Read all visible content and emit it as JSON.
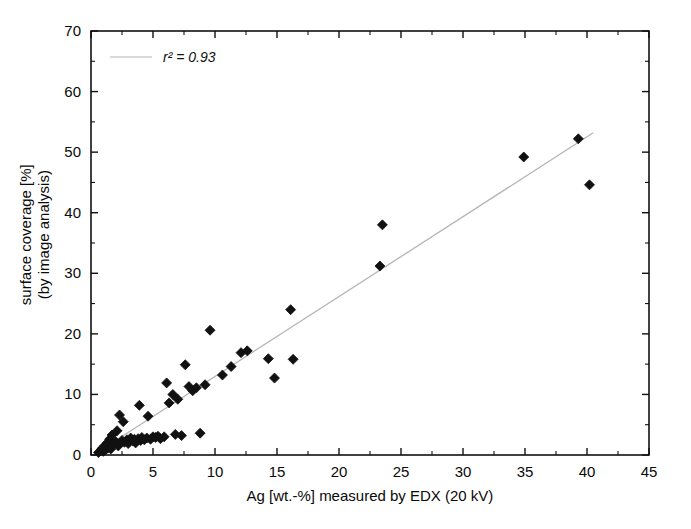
{
  "chart_data": {
    "type": "scatter",
    "title": "",
    "xlabel": "Ag [wt.-%] measured by EDX (20 kV)",
    "ylabel": "surface coverage [%]\n(by image analysis)",
    "ylabel_line1": "surface coverage [%]",
    "ylabel_line2": "(by image analysis)",
    "xlim": [
      0,
      45
    ],
    "ylim": [
      0,
      70
    ],
    "xticks": [
      0,
      5,
      10,
      15,
      20,
      25,
      30,
      35,
      40,
      45
    ],
    "yticks": [
      0,
      10,
      20,
      30,
      40,
      50,
      60,
      70
    ],
    "xminor_step": 2.5,
    "yminor_step": 5,
    "grid": false,
    "legend": {
      "position": "upper-left-inside",
      "entries": [
        {
          "label": "r² = 0.93",
          "marker": "line",
          "color": "#b0b0b0"
        }
      ],
      "r_squared": 0.93
    },
    "series": [
      {
        "name": "measurements",
        "marker": "diamond",
        "color": "#111111",
        "points": [
          [
            0.6,
            0.4
          ],
          [
            0.8,
            0.7
          ],
          [
            0.9,
            1.1
          ],
          [
            1.0,
            0.6
          ],
          [
            1.1,
            1.5
          ],
          [
            1.2,
            0.9
          ],
          [
            1.3,
            2.0
          ],
          [
            1.4,
            1.2
          ],
          [
            1.5,
            2.6
          ],
          [
            1.6,
            1.0
          ],
          [
            1.7,
            3.3
          ],
          [
            1.8,
            1.8
          ],
          [
            2.0,
            2.2
          ],
          [
            2.1,
            4.0
          ],
          [
            2.2,
            1.5
          ],
          [
            2.3,
            6.6
          ],
          [
            2.5,
            2.4
          ],
          [
            2.6,
            5.5
          ],
          [
            2.7,
            2.1
          ],
          [
            2.9,
            2.5
          ],
          [
            3.0,
            1.9
          ],
          [
            3.2,
            2.8
          ],
          [
            3.4,
            2.3
          ],
          [
            3.5,
            2.6
          ],
          [
            3.6,
            2.0
          ],
          [
            3.8,
            2.7
          ],
          [
            3.9,
            8.2
          ],
          [
            4.0,
            2.4
          ],
          [
            4.1,
            2.9
          ],
          [
            4.3,
            2.5
          ],
          [
            4.5,
            2.8
          ],
          [
            4.6,
            6.4
          ],
          [
            4.8,
            2.6
          ],
          [
            5.0,
            3.0
          ],
          [
            5.2,
            2.9
          ],
          [
            5.4,
            3.1
          ],
          [
            5.6,
            2.7
          ],
          [
            5.9,
            3.0
          ],
          [
            6.1,
            11.9
          ],
          [
            6.3,
            8.6
          ],
          [
            6.6,
            10.0
          ],
          [
            6.8,
            3.4
          ],
          [
            7.0,
            9.2
          ],
          [
            7.3,
            3.2
          ],
          [
            7.6,
            14.9
          ],
          [
            7.9,
            11.3
          ],
          [
            8.2,
            10.6
          ],
          [
            8.5,
            11.1
          ],
          [
            8.8,
            3.6
          ],
          [
            9.2,
            11.6
          ],
          [
            9.6,
            20.6
          ],
          [
            10.6,
            13.2
          ],
          [
            11.3,
            14.6
          ],
          [
            12.1,
            16.9
          ],
          [
            12.6,
            17.2
          ],
          [
            14.3,
            15.9
          ],
          [
            14.8,
            12.7
          ],
          [
            16.1,
            24.0
          ],
          [
            16.3,
            15.8
          ],
          [
            23.3,
            31.2
          ],
          [
            23.5,
            38.0
          ],
          [
            34.9,
            49.2
          ],
          [
            39.3,
            52.2
          ],
          [
            40.2,
            44.6
          ]
        ]
      }
    ],
    "fit_line": {
      "name": "linear regression",
      "color": "#b5b5b5",
      "x": [
        0.4,
        40.5
      ],
      "y": [
        0.3,
        53.2
      ]
    }
  },
  "axes": {
    "x_tick_labels": [
      "0",
      "5",
      "10",
      "15",
      "20",
      "25",
      "30",
      "35",
      "40",
      "45"
    ],
    "y_tick_labels": [
      "0",
      "10",
      "20",
      "30",
      "40",
      "50",
      "60",
      "70"
    ]
  }
}
